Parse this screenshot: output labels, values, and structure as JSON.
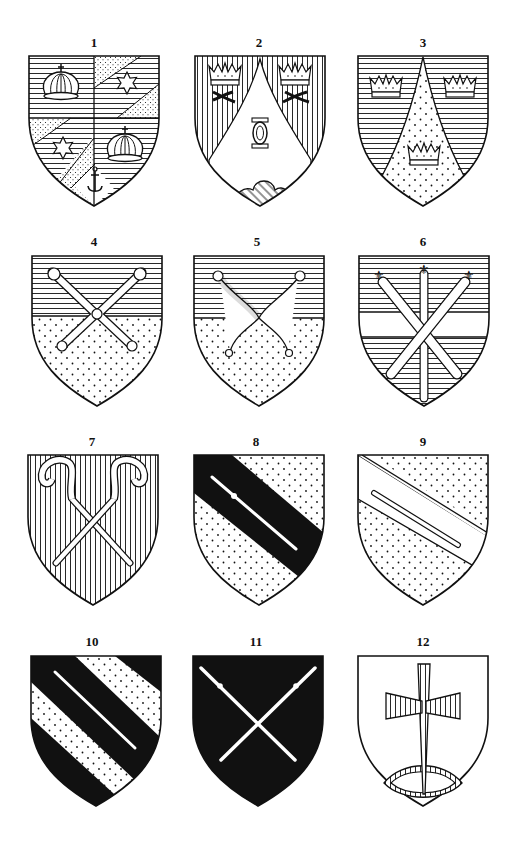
{
  "plate": {
    "description": "Plate of twelve heraldic shields (coats of arms), numbered 1–12 in a 3×4 grid",
    "colors": {
      "ink": "#111111",
      "paper": "#ffffff"
    }
  },
  "shields": [
    {
      "number": "1",
      "name": "Quarterly: crowns and stars on bends, with anchor",
      "charges": [
        "crown",
        "crown",
        "star",
        "star",
        "anchor"
      ],
      "tinctures": [
        "horizontal-hatch (azure)",
        "dotted (or)"
      ]
    },
    {
      "number": "2",
      "name": "Chapé: two crowns over crossed horns, knot and cloud",
      "charges": [
        "crown",
        "crown",
        "crossed-horns",
        "crossed-horns",
        "knot",
        "cloud"
      ],
      "tinctures": [
        "vertical-hatch (gules)",
        "plain (argent)",
        "diagonal-hatch (vert)"
      ]
    },
    {
      "number": "3",
      "name": "Chapé: three crowns",
      "charges": [
        "crown",
        "crown",
        "crown"
      ],
      "tinctures": [
        "horizontal-hatch (azure)",
        "dotted (or)"
      ]
    },
    {
      "number": "4",
      "name": "Per fess: two maces in saltire",
      "charges": [
        "mace",
        "mace"
      ],
      "tinctures": [
        "horizontal-hatch (azure)",
        "dotted (or)"
      ]
    },
    {
      "number": "5",
      "name": "Per fess: two sceptres in saltire",
      "charges": [
        "sceptre",
        "sceptre"
      ],
      "tinctures": [
        "horizontal-hatch (azure)",
        "dotted (or)"
      ]
    },
    {
      "number": "6",
      "name": "Fess: three fleur-de-lis sceptres",
      "charges": [
        "sceptre",
        "sceptre",
        "sceptre"
      ],
      "tinctures": [
        "horizontal-hatch (azure)",
        "plain (argent)"
      ]
    },
    {
      "number": "7",
      "name": "Two crosiers in saltire",
      "charges": [
        "crosier",
        "crosier"
      ],
      "tinctures": [
        "vertical-hatch (gules)",
        "dotted (or)"
      ]
    },
    {
      "number": "8",
      "name": "Bend sable charged with a staff",
      "charges": [
        "staff"
      ],
      "tinctures": [
        "dotted (or)",
        "black (sable)"
      ]
    },
    {
      "number": "9",
      "name": "Bend argent charged with a staff",
      "charges": [
        "staff"
      ],
      "tinctures": [
        "dotted (or)",
        "plain (argent)"
      ]
    },
    {
      "number": "10",
      "name": "Bendy: staff on bend sable",
      "charges": [
        "staff"
      ],
      "tinctures": [
        "black (sable)",
        "dotted (or)"
      ]
    },
    {
      "number": "11",
      "name": "Sable: two staves in saltire",
      "charges": [
        "staff",
        "staff"
      ],
      "tinctures": [
        "black (sable)",
        "plain (argent)"
      ]
    },
    {
      "number": "12",
      "name": "Argent: cross over a boat",
      "charges": [
        "cross",
        "boat"
      ],
      "tinctures": [
        "plain (argent)",
        "vertical-hatch (gules)"
      ]
    }
  ]
}
